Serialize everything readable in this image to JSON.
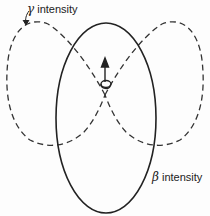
{
  "figure": {
    "labels": {
      "gamma": {
        "symbol": "γ",
        "text": "intensity"
      },
      "beta": {
        "symbol": "β",
        "text": "intensity"
      }
    },
    "curves": [
      {
        "name": "beta-intensity-pattern",
        "style": "solid",
        "shape": "ellipse",
        "orientation": "vertical"
      },
      {
        "name": "gamma-intensity-pattern",
        "style": "dashed",
        "shape": "two-lobe figure-eight",
        "orientation": "horizontal"
      }
    ],
    "center_element": {
      "name": "coil-with-spin-arrow",
      "arrow_direction": "up"
    },
    "colors": {
      "line": "#222222",
      "background": "#fdfdfd"
    }
  }
}
